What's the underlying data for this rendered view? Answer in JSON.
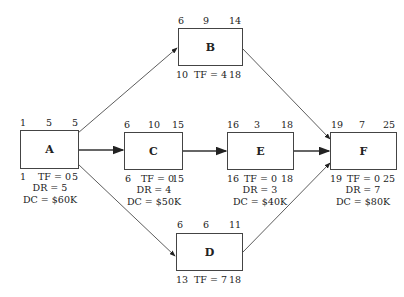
{
  "diagram": {
    "type": "activity-on-node network",
    "nodes": [
      {
        "id": "A",
        "es": "1",
        "dur": "5",
        "ef": "5",
        "ls": "1",
        "tf": "TF = 0",
        "lf": "5",
        "dr": "DR = 5",
        "dc": "DC = $60K"
      },
      {
        "id": "B",
        "es": "6",
        "dur": "9",
        "ef": "14",
        "ls": "10",
        "tf": "TF = 4",
        "lf": "18"
      },
      {
        "id": "C",
        "es": "6",
        "dur": "10",
        "ef": "15",
        "ls": "6",
        "tf": "TF = 0",
        "lf": "15",
        "dr": "DR = 4",
        "dc": "DC = $50K"
      },
      {
        "id": "D",
        "es": "6",
        "dur": "6",
        "ef": "11",
        "ls": "13",
        "tf": "TF = 7",
        "lf": "18"
      },
      {
        "id": "E",
        "es": "16",
        "dur": "3",
        "ef": "18",
        "ls": "16",
        "tf": "TF = 0",
        "lf": "18",
        "dr": "DR = 3",
        "dc": "DC = $40K"
      },
      {
        "id": "F",
        "es": "19",
        "dur": "7",
        "ef": "25",
        "ls": "19",
        "tf": "TF = 0",
        "lf": "25",
        "dr": "DR = 7",
        "dc": "DC = $80K"
      }
    ],
    "edges": [
      {
        "from": "A",
        "to": "B"
      },
      {
        "from": "A",
        "to": "C"
      },
      {
        "from": "A",
        "to": "D"
      },
      {
        "from": "C",
        "to": "E"
      },
      {
        "from": "B",
        "to": "F"
      },
      {
        "from": "E",
        "to": "F"
      },
      {
        "from": "D",
        "to": "F"
      }
    ]
  }
}
